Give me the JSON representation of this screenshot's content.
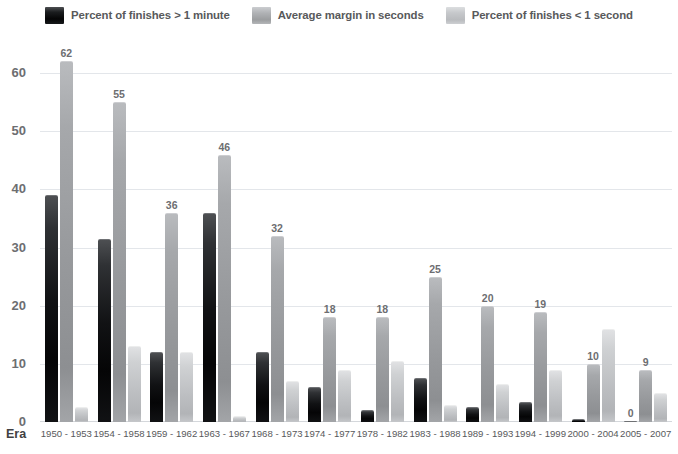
{
  "legend": {
    "items": [
      {
        "label": "Percent of finishes > 1 minute",
        "color": "#111214",
        "key": "s0"
      },
      {
        "label": "Average margin in seconds",
        "color": "#a6a8ab",
        "key": "s1"
      },
      {
        "label": "Percent of finishes < 1 second",
        "color": "#c6c8cb",
        "key": "s2"
      }
    ]
  },
  "axis": {
    "x_title": "Era",
    "y_ticks": [
      "60",
      "50",
      "40",
      "30",
      "20",
      "10",
      "0"
    ]
  },
  "chart_data": {
    "type": "bar",
    "title": "",
    "xlabel": "Era",
    "ylabel": "",
    "ylim": [
      0,
      65
    ],
    "yticks": [
      0,
      10,
      20,
      30,
      40,
      50,
      60
    ],
    "grid": true,
    "legend_position": "top",
    "categories": [
      "1950 - 1953",
      "1954 - 1958",
      "1959 - 1962",
      "1963 - 1967",
      "1968 - 1973",
      "1974 - 1977",
      "1978 - 1982",
      "1983 - 1988",
      "1989 - 1993",
      "1994 - 1999",
      "2000 - 2004",
      "2005 - 2007"
    ],
    "series": [
      {
        "name": "Percent of finishes > 1 minute",
        "color": "#111214",
        "values": [
          39,
          31.5,
          12,
          36,
          12,
          6,
          2,
          7.5,
          2.5,
          3.5,
          0.5,
          0
        ],
        "labels": [
          "",
          "",
          "",
          "",
          "",
          "",
          "",
          "",
          "",
          "",
          "",
          "0"
        ]
      },
      {
        "name": "Average margin in seconds",
        "color": "#a6a8ab",
        "values": [
          62,
          55,
          36,
          46,
          32,
          18,
          18,
          25,
          20,
          19,
          10,
          9
        ],
        "labels": [
          "62",
          "55",
          "36",
          "46",
          "32",
          "18",
          "18",
          "25",
          "20",
          "19",
          "10",
          "9"
        ]
      },
      {
        "name": "Percent of finishes < 1 second",
        "color": "#c6c8cb",
        "values": [
          2.5,
          13,
          12,
          1,
          7,
          9,
          10.5,
          3,
          6.5,
          9,
          16,
          5
        ],
        "labels": [
          "",
          "",
          "",
          "",
          "",
          "",
          "",
          "",
          "",
          "",
          "",
          ""
        ]
      }
    ]
  }
}
